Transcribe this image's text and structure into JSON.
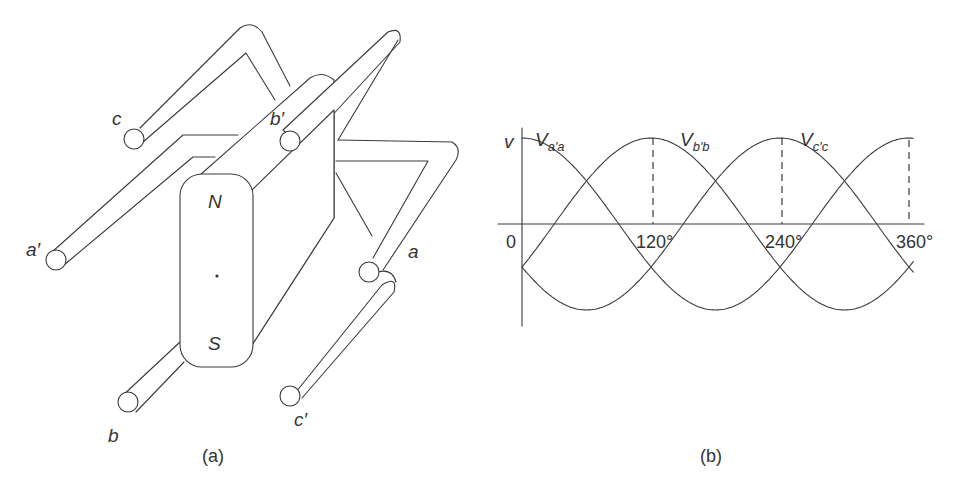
{
  "figure_a": {
    "caption": "(a)",
    "magnet": {
      "north_label": "N",
      "south_label": "S"
    },
    "conductor_labels": {
      "a": "a",
      "a_prime": "a′",
      "b": "b",
      "b_prime": "b′",
      "c": "c",
      "c_prime": "c′"
    }
  },
  "figure_b": {
    "caption": "(b)",
    "y_axis_label": "v",
    "origin_label": "0",
    "tick_labels": [
      "120°",
      "240°",
      "360°"
    ],
    "curve_labels": [
      {
        "main": "V",
        "sub": "a′a"
      },
      {
        "main": "V",
        "sub": "b′b"
      },
      {
        "main": "V",
        "sub": "c′c"
      }
    ]
  },
  "chart_data": {
    "type": "line",
    "title": "",
    "xlabel": "",
    "ylabel": "v",
    "x": [
      0,
      30,
      60,
      90,
      120,
      150,
      180,
      210,
      240,
      270,
      300,
      330,
      360
    ],
    "x_tick_labels": [
      "0",
      "120°",
      "240°",
      "360°"
    ],
    "xlim": [
      0,
      360
    ],
    "ylim": [
      -1,
      1
    ],
    "grid": false,
    "series": [
      {
        "name": "V_a'a",
        "values": [
          1.0,
          0.87,
          0.5,
          0.0,
          -0.5,
          -0.87,
          -1.0,
          -0.87,
          -0.5,
          0.0,
          0.5,
          0.87,
          1.0
        ]
      },
      {
        "name": "V_b'b",
        "values": [
          -0.5,
          0.0,
          0.5,
          0.87,
          1.0,
          0.87,
          0.5,
          0.0,
          -0.5,
          -0.87,
          -1.0,
          -0.87,
          -0.5
        ]
      },
      {
        "name": "V_c'c",
        "values": [
          -0.5,
          -0.87,
          -1.0,
          -0.87,
          -0.5,
          0.0,
          0.5,
          0.87,
          1.0,
          0.87,
          0.5,
          0.0,
          -0.5
        ]
      }
    ],
    "annotations": [
      "dashed vertical lines at 120°, 240°, 360° marking peaks"
    ]
  }
}
